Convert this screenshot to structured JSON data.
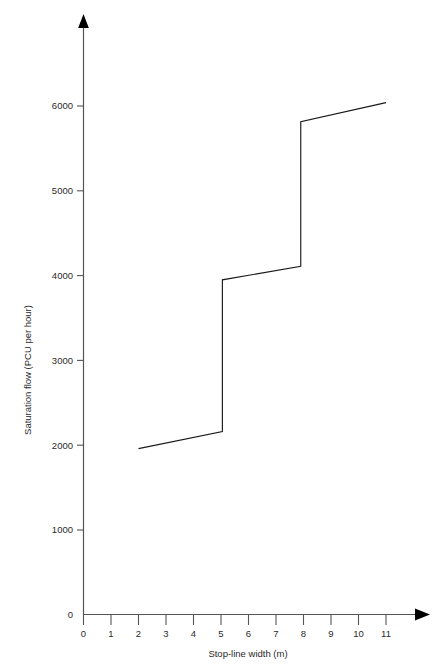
{
  "chart_data": {
    "type": "line",
    "title": "",
    "subtitle": "",
    "xlabel": "Stop-line width (m)",
    "ylabel": "Saturation flow (PCU per hour)",
    "xlim": [
      0,
      11.6
    ],
    "ylim": [
      0,
      6800
    ],
    "x_ticks": [
      0,
      1,
      2,
      3,
      4,
      5,
      6,
      7,
      8,
      9,
      10,
      11
    ],
    "x_tick_labels": [
      "0",
      "1",
      "2",
      "3",
      "4",
      "5",
      "6",
      "7",
      "8",
      "9",
      "10",
      "11"
    ],
    "y_ticks": [
      0,
      1000,
      2000,
      3000,
      4000,
      5000,
      6000
    ],
    "y_tick_labels": [
      "0",
      "1000",
      "2000",
      "3000",
      "4000",
      "5000",
      "6000"
    ],
    "grid": false,
    "legend": false,
    "legend_position": "none",
    "axis_arrows": true,
    "series": [
      {
        "name": "Saturation flow",
        "color": "#1a1a1a",
        "points": [
          {
            "x": 2.0,
            "y": 1960
          },
          {
            "x": 5.05,
            "y": 2160
          },
          {
            "x": 5.05,
            "y": 3950
          },
          {
            "x": 7.9,
            "y": 4110
          },
          {
            "x": 7.9,
            "y": 5815
          },
          {
            "x": 11.0,
            "y": 6040
          }
        ]
      }
    ],
    "annotations": [],
    "step_jumps": [
      {
        "x": 5.05,
        "from": 2160,
        "to": 3950
      },
      {
        "x": 7.9,
        "from": 4110,
        "to": 5815
      }
    ]
  },
  "axes": {
    "x_axis_name": "x-axis",
    "y_axis_name": "y-axis"
  }
}
